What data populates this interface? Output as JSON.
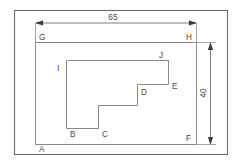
{
  "drawing": {
    "title": "Stepped L-shaped profile inside rectangle",
    "background_color": "#ffffff",
    "line_color": "#8a8a8a",
    "frame_color": "#6b6b6b",
    "dimension_color": "#6e6e6e",
    "label_color": "#4a4a4a"
  },
  "dimensions": [
    {
      "id": "width",
      "value": "65",
      "orientation": "horizontal",
      "position": "top",
      "measures": "G-H"
    },
    {
      "id": "height",
      "value": "40",
      "orientation": "vertical",
      "position": "right",
      "measures": "H-F"
    }
  ],
  "vertices": [
    {
      "id": "A",
      "label": "A",
      "x": 39,
      "y": 152
    },
    {
      "id": "B",
      "label": "B",
      "x": 70,
      "y": 137
    },
    {
      "id": "C",
      "label": "C",
      "x": 102,
      "y": 137
    },
    {
      "id": "D",
      "label": "D",
      "x": 141,
      "y": 95
    },
    {
      "id": "E",
      "label": "E",
      "x": 172,
      "y": 89
    },
    {
      "id": "F",
      "label": "F",
      "x": 186,
      "y": 141
    },
    {
      "id": "G",
      "label": "G",
      "x": 39,
      "y": 40
    },
    {
      "id": "H",
      "label": "H",
      "x": 186,
      "y": 40
    },
    {
      "id": "I",
      "label": "I",
      "x": 57,
      "y": 71
    },
    {
      "id": "J",
      "label": "J",
      "x": 159,
      "y": 58
    }
  ],
  "outer_rectangle": {
    "name": "A-G-H-F",
    "points": "35,42 197,42 197,145 35,145"
  },
  "inner_profile": {
    "name": "I-J-E-D-C-B",
    "points": "66,128 66,60 168,60 168,84 137,84 137,105 98,105 98,128"
  },
  "frame": {
    "x": 14,
    "y": 10,
    "width": 214,
    "height": 145
  }
}
